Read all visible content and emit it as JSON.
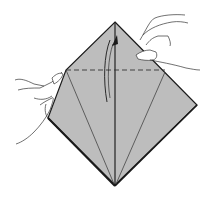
{
  "diagram": {
    "colors": {
      "paper": "#bdbdbd",
      "outline": "#1a1a1a",
      "crease": "#444444",
      "background": "#ffffff"
    },
    "elements": [
      {
        "name": "paper-diamond",
        "type": "shape"
      },
      {
        "name": "fold-line-dashed",
        "type": "valley-fold"
      },
      {
        "name": "center-crease",
        "type": "crease"
      },
      {
        "name": "left-diagonal-crease",
        "type": "crease"
      },
      {
        "name": "right-diagonal-crease",
        "type": "crease"
      },
      {
        "name": "fold-arrow",
        "type": "arrow",
        "direction": "up"
      },
      {
        "name": "left-hand",
        "type": "hand"
      },
      {
        "name": "right-hand",
        "type": "hand"
      }
    ]
  }
}
